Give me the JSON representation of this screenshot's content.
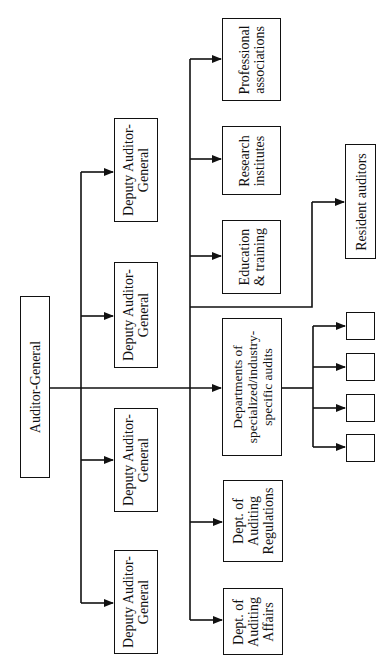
{
  "diagram": {
    "type": "org-chart",
    "orientation": "rotated-90-ccw",
    "root": {
      "id": "auditor-general",
      "lines": [
        "Auditor-General"
      ]
    },
    "deputies": [
      {
        "id": "deputy-1",
        "lines": [
          "Deputy Auditor-",
          "General"
        ]
      },
      {
        "id": "deputy-2",
        "lines": [
          "Deputy Auditor-",
          "General"
        ]
      },
      {
        "id": "deputy-3",
        "lines": [
          "Deputy Auditor-",
          "General"
        ]
      },
      {
        "id": "deputy-4",
        "lines": [
          "Deputy Auditor-",
          "General"
        ]
      }
    ],
    "departments": [
      {
        "id": "professional-associations",
        "lines": [
          "Professional",
          "associations"
        ]
      },
      {
        "id": "research-institutes",
        "lines": [
          "Research",
          "institutes"
        ]
      },
      {
        "id": "education-training",
        "lines": [
          "Education",
          "& training"
        ]
      },
      {
        "id": "specialized-audits",
        "lines": [
          "Departments of",
          "specialized/industry-",
          "specific audits"
        ]
      },
      {
        "id": "auditing-regulations",
        "lines": [
          "Dept. of",
          "Auditing",
          "Regulations"
        ]
      },
      {
        "id": "auditing-affairs",
        "lines": [
          "Dept. of",
          "Auditing",
          "Affairs"
        ]
      }
    ],
    "resident": {
      "id": "resident-auditors",
      "lines": [
        "Resident auditors"
      ]
    },
    "sub_units": [
      {
        "id": "sub-unit-1",
        "label": ""
      },
      {
        "id": "sub-unit-2",
        "label": ""
      },
      {
        "id": "sub-unit-3",
        "label": ""
      },
      {
        "id": "sub-unit-4",
        "label": ""
      }
    ],
    "colors": {
      "line": "#111111",
      "background": "#ffffff"
    }
  }
}
